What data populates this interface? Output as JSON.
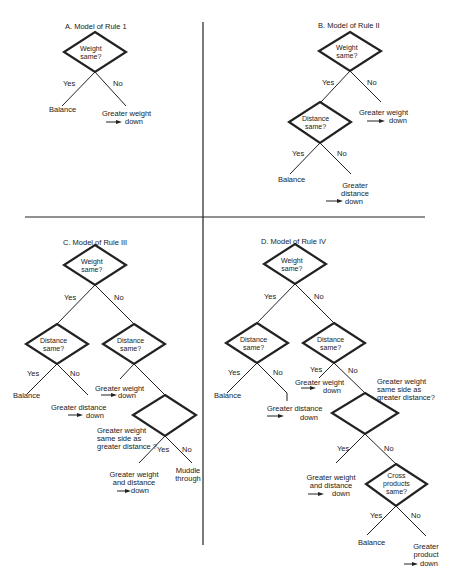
{
  "figure": {
    "panels": [
      {
        "id": "A",
        "title": "A.  Model of Rule 1",
        "nodes": {
          "weight_same": "Weight\nsame?"
        },
        "branches": {
          "yes": "Yes",
          "no": "No"
        },
        "outcomes": {
          "balance": "Balance",
          "greater_weight_1": "Greater weight",
          "greater_weight_2": "down"
        }
      },
      {
        "id": "B",
        "title": "B.  Model of Rule II",
        "nodes": {
          "weight_same": "Weight\nsame?",
          "distance_same": "Distance\nsame?"
        },
        "branches": {
          "yes": "Yes",
          "no": "No",
          "yes2": "Yes",
          "no2": "No"
        },
        "outcomes": {
          "greater_weight_1": "Greater weight",
          "greater_weight_2": "down",
          "balance": "Balance",
          "greater_distance_1": "Greater",
          "greater_distance_2": "distance",
          "greater_distance_3": "down"
        }
      },
      {
        "id": "C",
        "title": "C.  Model of Rule III",
        "nodes": {
          "weight_same": "Weight\nsame?",
          "distance_same_left": "Distance\nsame?",
          "distance_same_right": "Distance\nsame?",
          "question_1": "Greater weight",
          "question_2": "same side as",
          "question_3": "greater distance ?"
        },
        "branches": {
          "yes": "Yes",
          "no": "No",
          "yes2": "Yes",
          "no2": "No",
          "yes3": "Yes",
          "no3": "No"
        },
        "outcomes": {
          "balance": "Balance",
          "greater_distance_1": "Greater distance",
          "greater_distance_2": "down",
          "greater_weight_1": "Greater weight",
          "greater_weight_2": "down",
          "weight_and_distance_1": "Greater weight",
          "weight_and_distance_2": "and distance",
          "weight_and_distance_3": "down",
          "muddle_1": "Muddle",
          "muddle_2": "through"
        }
      },
      {
        "id": "D",
        "title": "D.  Model of Rule IV",
        "nodes": {
          "weight_same": "Weight\nsame?",
          "distance_same_left": "Distance\nsame?",
          "distance_same_right": "Distance\nsame?",
          "question_1": "Greater weight",
          "question_2": "same side as",
          "question_3": "greater distance?",
          "cross_products": "Cross\nproducts\nsame?"
        },
        "branches": {
          "yes": "Yes",
          "no": "No",
          "yes2": "Yes",
          "no2": "No",
          "yes3": "Yes",
          "no3": "No",
          "yes4": "Yes",
          "no4": "No",
          "yes5": "Yes",
          "no5": "No"
        },
        "outcomes": {
          "balance": "Balance",
          "greater_distance_1": "Greater distance",
          "greater_distance_2": "down",
          "greater_weight_1": "Greater weight",
          "greater_weight_2": "down",
          "weight_and_distance_1": "Greater weight",
          "weight_and_distance_2": "and distance",
          "weight_and_distance_3": "down",
          "balance2": "Balance",
          "greater_product_1": "Greater",
          "greater_product_2": "product",
          "greater_product_3": "down"
        }
      }
    ]
  }
}
